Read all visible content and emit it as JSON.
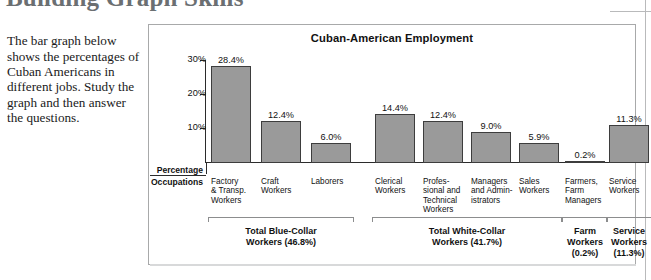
{
  "page": {
    "heading": "Building Graph Skills",
    "intro": "The bar graph below shows the percentages of Cuban Americans in different jobs. Study the graph and then answer the questions."
  },
  "chart_data": {
    "type": "bar",
    "title": "Cuban-American Employment",
    "xlabel": "Occupations",
    "ylabel": "Percentage",
    "ylim": [
      0,
      30
    ],
    "grid": false,
    "legend": "none",
    "ytick_labels": [
      "30%",
      "20%",
      "10%"
    ],
    "ytick_values": [
      30,
      20,
      10
    ],
    "categories": [
      "Factory & Transp. Workers",
      "Craft Workers",
      "Laborers",
      "Clerical Workers",
      "Professional and Technical Workers",
      "Managers and Administrators",
      "Sales Workers",
      "Farmers, Farm Managers",
      "Service Workers"
    ],
    "category_lines": [
      [
        "Factory",
        "& Transp.",
        "Workers"
      ],
      [
        "Craft",
        "Workers"
      ],
      [
        "Laborers"
      ],
      [
        "Clerical",
        "Workers"
      ],
      [
        "Profes-",
        "sional and",
        "Technical",
        "Workers"
      ],
      [
        "Managers",
        "and Admin-",
        "istrators"
      ],
      [
        "Sales",
        "Workers"
      ],
      [
        "Farmers,",
        "Farm",
        "Managers"
      ],
      [
        "Service",
        "Workers"
      ]
    ],
    "values": [
      28.4,
      12.4,
      6.0,
      14.4,
      12.4,
      9.0,
      5.9,
      0.2,
      11.3
    ],
    "value_labels": [
      "28.4%",
      "12.4%",
      "6.0%",
      "14.4%",
      "12.4%",
      "9.0%",
      "5.9%",
      "0.2%",
      "11.3%"
    ],
    "bar_color": "#9a9a9a",
    "bar_border_color": "#3d3d3d",
    "groups": [
      {
        "label_lines": [
          "Total Blue-Collar",
          "Workers (46.8%)"
        ],
        "total": 46.8,
        "members": [
          0,
          1,
          2
        ]
      },
      {
        "label_lines": [
          "Total White-Collar",
          "Workers (41.7%)"
        ],
        "total": 41.7,
        "members": [
          3,
          4,
          5,
          6
        ]
      },
      {
        "label_lines": [
          "Farm",
          "Workers",
          "(0.2%)"
        ],
        "total": 0.2,
        "members": [
          7
        ]
      },
      {
        "label_lines": [
          "Service",
          "Workers",
          "(11.3%)"
        ],
        "total": 11.3,
        "members": [
          8
        ]
      }
    ]
  }
}
